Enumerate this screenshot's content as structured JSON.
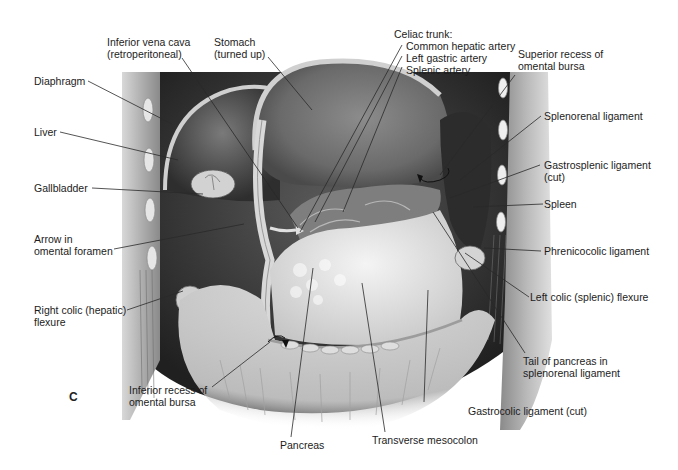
{
  "figure": {
    "panel_letter": "C",
    "labels": {
      "ivc": {
        "lines": [
          "Inferior vena cava",
          "(retroperitoneal)"
        ]
      },
      "stomach": {
        "lines": [
          "Stomach",
          "(turned up)"
        ]
      },
      "celiac": {
        "lines": [
          "Celiac trunk:",
          "Common hepatic artery",
          "Left gastric artery",
          "Splenic artery"
        ]
      },
      "superior_recess": {
        "lines": [
          "Superior recess of",
          "omental bursa"
        ]
      },
      "diaphragm": {
        "lines": [
          "Diaphragm"
        ]
      },
      "liver": {
        "lines": [
          "Liver"
        ]
      },
      "gallbladder": {
        "lines": [
          "Gallbladder"
        ]
      },
      "arrow_foramen": {
        "lines": [
          "Arrow in",
          "omental foramen"
        ]
      },
      "right_colic": {
        "lines": [
          "Right colic (hepatic)",
          "flexure"
        ]
      },
      "splenorenal": {
        "lines": [
          "Splenorenal ligament"
        ]
      },
      "gastrosplenic": {
        "lines": [
          "Gastrosplenic ligament",
          "(cut)"
        ]
      },
      "spleen": {
        "lines": [
          "Spleen"
        ]
      },
      "phrenicocolic": {
        "lines": [
          "Phrenicocolic ligament"
        ]
      },
      "left_colic": {
        "lines": [
          "Left colic (splenic) flexure"
        ]
      },
      "tail_pancreas": {
        "lines": [
          "Tail of pancreas in",
          "splenorenal ligament"
        ]
      },
      "inferior_recess": {
        "lines": [
          "Inferior recess of",
          "omental bursa"
        ]
      },
      "gastrocolic": {
        "lines": [
          "Gastrocolic ligament (cut)"
        ]
      },
      "pancreas": {
        "lines": [
          "Pancreas"
        ]
      },
      "transverse_mesocolon": {
        "lines": [
          "Transverse mesocolon"
        ]
      }
    },
    "colors": {
      "background": "#ffffff",
      "text": "#1c1c1c",
      "tissue_light": "#e8e8e8",
      "tissue_mid": "#a8a8a8",
      "tissue_dark": "#3a3a3a"
    }
  }
}
